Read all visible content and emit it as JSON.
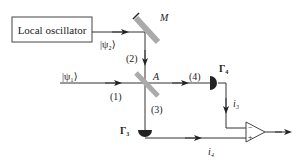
{
  "diagram": {
    "oscillator_label": "Local oscillator",
    "psi2_label": "|ψ₂⟩",
    "psi1_label": "|ψ₁⟩",
    "mirror_label": "M",
    "splitter_label": "A",
    "path1_label": "(1)",
    "path2_label": "(2)",
    "path3_label": "(3)",
    "path4_label": "(4)",
    "detector3_label": "Γ₃",
    "detector4_label": "Γ₄",
    "current3_label": "i₃",
    "current4_label": "i₄",
    "amp_minus": "−",
    "amp_plus": "+"
  }
}
